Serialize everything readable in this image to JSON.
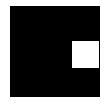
{
  "shapes": {
    "outer_square": {
      "color": "#000000"
    },
    "inner_square": {
      "color": "#ffffff"
    }
  },
  "background": "#ffffff"
}
